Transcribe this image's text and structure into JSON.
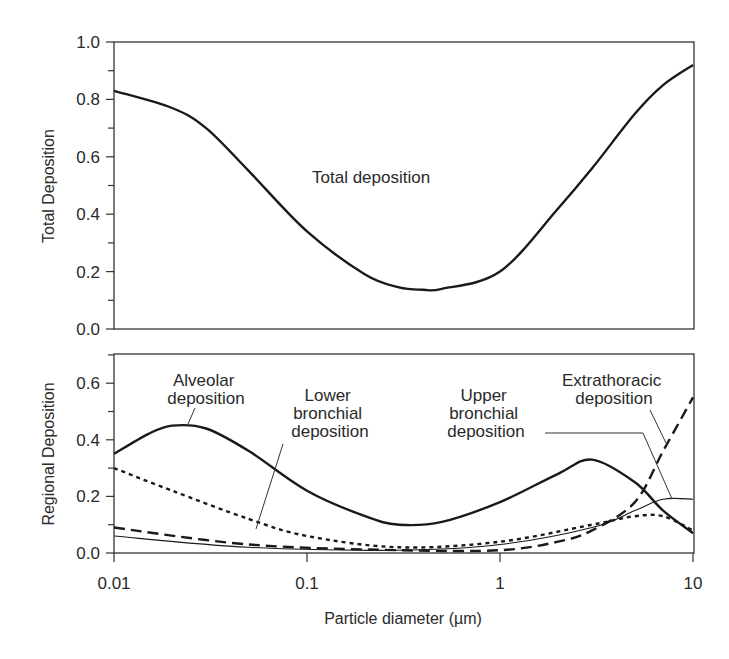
{
  "chart_data": [
    {
      "type": "line",
      "title": "",
      "xlabel": "",
      "ylabel": "Total Deposition",
      "xscale": "log",
      "xlim": [
        0.01,
        10
      ],
      "ylim": [
        0,
        1.0
      ],
      "yticks": [
        "0.0",
        "0.2",
        "0.4",
        "0.6",
        "0.8",
        "1.0"
      ],
      "grid": false,
      "legend": "none",
      "annotations": [
        {
          "text": "Total deposition"
        }
      ],
      "series": [
        {
          "name": "Total deposition",
          "style": "solid-thick",
          "x": [
            0.01,
            0.02,
            0.03,
            0.05,
            0.1,
            0.2,
            0.3,
            0.4,
            0.5,
            1,
            2,
            3,
            5,
            7,
            10
          ],
          "values": [
            0.83,
            0.77,
            0.7,
            0.55,
            0.34,
            0.19,
            0.145,
            0.137,
            0.14,
            0.2,
            0.42,
            0.56,
            0.75,
            0.85,
            0.92
          ]
        }
      ]
    },
    {
      "type": "line",
      "title": "",
      "xlabel": "Particle diameter  (µm)",
      "ylabel": "Regional Deposition",
      "xscale": "log",
      "xlim": [
        0.01,
        10
      ],
      "ylim": [
        0,
        0.7
      ],
      "xticks": [
        "0.01",
        "0.1",
        "1",
        "10"
      ],
      "yticks": [
        "0.0",
        "0.2",
        "0.4",
        "0.6"
      ],
      "grid": false,
      "legend": "none",
      "annotations": [
        {
          "text": "Alveolar deposition"
        },
        {
          "text": "Lower bronchial deposition"
        },
        {
          "text": "Upper bronchial deposition"
        },
        {
          "text": "Extrathoracic deposition"
        }
      ],
      "series": [
        {
          "name": "Alveolar deposition",
          "style": "solid-thick",
          "x": [
            0.01,
            0.015,
            0.02,
            0.03,
            0.05,
            0.1,
            0.2,
            0.3,
            0.5,
            1,
            2,
            3,
            5,
            7,
            10
          ],
          "values": [
            0.35,
            0.42,
            0.45,
            0.44,
            0.36,
            0.22,
            0.13,
            0.1,
            0.11,
            0.18,
            0.28,
            0.33,
            0.25,
            0.15,
            0.07
          ]
        },
        {
          "name": "Lower bronchial deposition",
          "style": "dotted",
          "x": [
            0.01,
            0.02,
            0.05,
            0.1,
            0.3,
            1,
            3,
            5,
            7,
            10
          ],
          "values": [
            0.3,
            0.22,
            0.12,
            0.06,
            0.02,
            0.04,
            0.1,
            0.13,
            0.13,
            0.08
          ]
        },
        {
          "name": "Upper bronchial deposition",
          "style": "solid-thin",
          "x": [
            0.01,
            0.05,
            0.3,
            1,
            3,
            5,
            7,
            10
          ],
          "values": [
            0.06,
            0.02,
            0.01,
            0.03,
            0.09,
            0.15,
            0.19,
            0.19
          ]
        },
        {
          "name": "Extrathoracic deposition",
          "style": "long-dash",
          "x": [
            0.01,
            0.05,
            0.3,
            1,
            2,
            3,
            5,
            7,
            10
          ],
          "values": [
            0.09,
            0.03,
            0.01,
            0.01,
            0.04,
            0.08,
            0.18,
            0.36,
            0.55
          ]
        }
      ]
    }
  ],
  "labels": {
    "top_ylabel": "Total Deposition",
    "bottom_ylabel": "Regional Deposition",
    "xlabel": "Particle diameter  (µm)",
    "total": "Total deposition",
    "alveolar": [
      "Alveolar",
      "deposition"
    ],
    "lower": [
      "Lower",
      "bronchial",
      "deposition"
    ],
    "upper": [
      "Upper",
      "bronchial",
      "deposition"
    ],
    "extra": [
      "Extrathoracic",
      "deposition"
    ]
  },
  "ticks": {
    "top_y": [
      "0.0",
      "0.2",
      "0.4",
      "0.6",
      "0.8",
      "1.0"
    ],
    "bottom_y": [
      "0.0",
      "0.2",
      "0.4",
      "0.6"
    ],
    "x": [
      "0.01",
      "0.1",
      "1",
      "10"
    ]
  },
  "colors": {
    "ink": "#1a1a1a",
    "frame": "#333333"
  }
}
